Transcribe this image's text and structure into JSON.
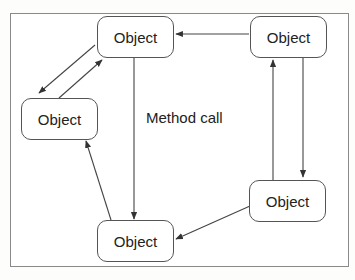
{
  "diagram": {
    "nodes": [
      {
        "id": "top-center",
        "label": "Object"
      },
      {
        "id": "top-right",
        "label": "Object"
      },
      {
        "id": "left",
        "label": "Object"
      },
      {
        "id": "bottom-right",
        "label": "Object"
      },
      {
        "id": "bottom-center",
        "label": "Object"
      }
    ],
    "edges": [
      {
        "from": "top-right",
        "to": "top-center"
      },
      {
        "from": "top-center",
        "to": "left"
      },
      {
        "from": "left",
        "to": "top-center"
      },
      {
        "from": "top-center",
        "to": "bottom-center"
      },
      {
        "from": "bottom-center",
        "to": "left"
      },
      {
        "from": "bottom-right",
        "to": "top-right"
      },
      {
        "from": "top-right",
        "to": "bottom-right"
      },
      {
        "from": "bottom-right",
        "to": "bottom-center"
      }
    ],
    "annotation": "Method call",
    "colors": {
      "stroke": "#555555",
      "frame": "#8a8a8a",
      "text": "#222222"
    }
  }
}
